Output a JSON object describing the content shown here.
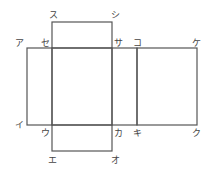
{
  "diagram": {
    "type": "net-of-rectangular-prism",
    "stroke_color": "#555555",
    "label_color": "#444444",
    "labels": [
      {
        "id": "su",
        "text": "ス",
        "x": 49,
        "y": 18
      },
      {
        "id": "shi",
        "text": "シ",
        "x": 111,
        "y": 18
      },
      {
        "id": "a",
        "text": "ア",
        "x": 16,
        "y": 46
      },
      {
        "id": "se",
        "text": "セ",
        "x": 41,
        "y": 46
      },
      {
        "id": "sa",
        "text": "サ",
        "x": 114,
        "y": 46
      },
      {
        "id": "ko",
        "text": "コ",
        "x": 133,
        "y": 46
      },
      {
        "id": "ke",
        "text": "ケ",
        "x": 192,
        "y": 46
      },
      {
        "id": "i",
        "text": "イ",
        "x": 16,
        "y": 128
      },
      {
        "id": "u",
        "text": "ウ",
        "x": 41,
        "y": 136
      },
      {
        "id": "ka",
        "text": "カ",
        "x": 114,
        "y": 136
      },
      {
        "id": "ki",
        "text": "キ",
        "x": 133,
        "y": 136
      },
      {
        "id": "ku",
        "text": "ク",
        "x": 192,
        "y": 136
      },
      {
        "id": "e",
        "text": "エ",
        "x": 48,
        "y": 163
      },
      {
        "id": "o",
        "text": "オ",
        "x": 111,
        "y": 163
      }
    ]
  }
}
